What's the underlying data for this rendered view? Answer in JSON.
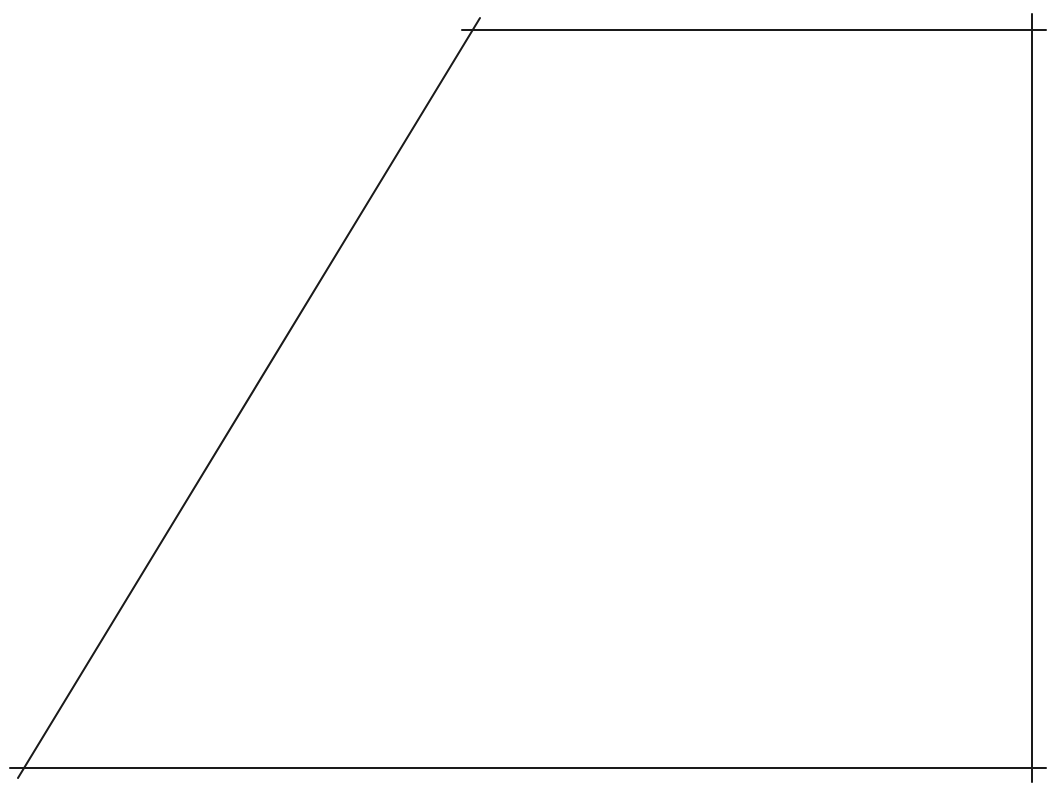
{
  "diagram": {
    "type": "line-drawing",
    "shape": "trapezoid",
    "stroke_color": "#1a1a1a",
    "background_color": "#ffffff",
    "stroke_width": 2,
    "lines": [
      {
        "id": "top-edge",
        "x1": 462,
        "y1": 30,
        "x2": 1046,
        "y2": 30
      },
      {
        "id": "right-edge",
        "x1": 1032,
        "y1": 14,
        "x2": 1032,
        "y2": 782
      },
      {
        "id": "bottom-edge",
        "x1": 10,
        "y1": 768,
        "x2": 1046,
        "y2": 768
      },
      {
        "id": "slanted-left-edge",
        "x1": 18,
        "y1": 778,
        "x2": 480,
        "y2": 18
      }
    ],
    "caption": ""
  }
}
